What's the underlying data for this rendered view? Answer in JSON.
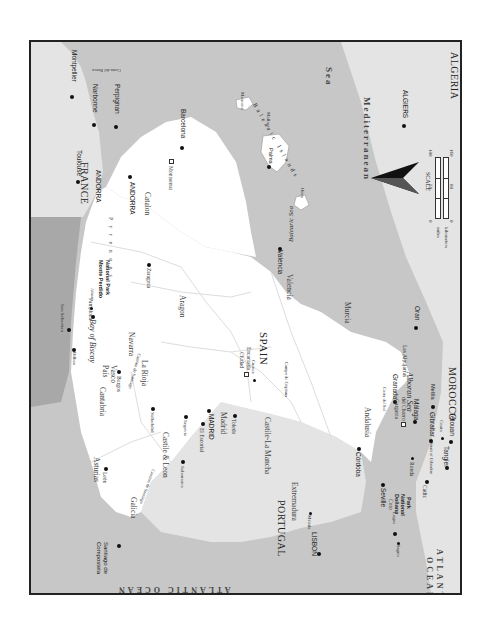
{
  "map": {
    "title": "SPAIN",
    "orientation": "rotated 90 degrees clockwise (north to the left)",
    "colors": {
      "spain_land": "#ffffff",
      "neighbor_land": "#e4e4e4",
      "sea": "#c7c7c7",
      "bay_of_biscay": "#a8a8a8",
      "border": "#222222",
      "region_lines": "#dddddd"
    },
    "countries": {
      "spain": "SPAIN",
      "france": "FRANCE",
      "portugal": "PORTUGAL",
      "andorra": "ANDORRA",
      "morocco": "MOROCCO",
      "algeria": "ALGERIA"
    },
    "seas": {
      "bay_of_biscay": "Bay of Biscay",
      "atlantic_top": "ATLANTIC OCEAN",
      "atlantic_bottom_1": "ATLANTIC",
      "atlantic_bottom_2": "OCEAN",
      "mediterranean_1": "Mediterranean",
      "mediterranean_2": "Sea",
      "balearic_sea": "Balearic Sea",
      "alboran_sea": "Alboran Sea",
      "strait": "Strait of Gibraltar",
      "costa_brava": "Costa del Brava",
      "costa_del_sol": "Costa del Sol",
      "balearic_islands": "Balearic Islands",
      "pyrenees": "P y r e n e e s"
    },
    "regions": {
      "galicia": "Galicia",
      "asturias": "Asturias",
      "cantabria": "Cantabria",
      "pais_vasco_1": "País",
      "pais_vasco_2": "Vasco",
      "navarra": "Navarra",
      "la_rioja": "La Rioja",
      "aragon": "Aragon",
      "catalon": "Catalon",
      "castile_leon": "Castile & Leon",
      "madrid": "Madrid",
      "castile_la_mancha": "Castile-La Mancha",
      "valencia": "Valencia",
      "murcia": "Murcia",
      "extremadura": "Extremadura",
      "andalusia": "Andalusia",
      "las_alpujarras": "Las Alpujarras",
      "camino_1": "Camino de Santiago",
      "camino_2": "Camino de Santiago",
      "campo": "Campo de Criptana",
      "menorca": "Menorca",
      "mallorca": "Mallorca",
      "ibiza": "Ibiza"
    },
    "cities": {
      "montpellier": "Montpellier",
      "narbonne": "Narbonne",
      "perpignan": "Perpignan",
      "toulouse": "Toulouse",
      "andorra_city": "ANDORRA",
      "barcelona": "Barcelona",
      "montserrat": "Montserrat",
      "palma": "Palma",
      "algiers": "ALGIERS",
      "oran": "Oran",
      "melilla": "Melilla",
      "san_sebastian": "San Sebastian",
      "bilbao": "Bilbao",
      "pamplona": "Pamplona",
      "ainsa": "Aínsa",
      "monte_perdido_1": "Monte Perdido",
      "monte_perdido_2": "National Park",
      "zaragoza": "Zaragoza",
      "burgos": "Burgos",
      "leon": "León",
      "valladolid": "Valladolid",
      "salamanca": "Salamanca",
      "segovia": "Segovia",
      "el_escorial": "El Escorial",
      "madrid_city": "MADRID",
      "toledo": "Toledo",
      "ciudad_1": "Ciudad",
      "ciudad_2": "Encantada",
      "cuenca": "Cuenca",
      "valencia_city": "Valencia",
      "santiago_1": "Santiago de",
      "santiago_2": "Compostela",
      "lisbon": "LISBON",
      "lagos": "Lagos",
      "sagres": "Sagres",
      "merida": "Mérida",
      "cordoba": "Córdoba",
      "granada": "Granada",
      "garganta_1": "Garganta",
      "garganta_2": "del Chorro",
      "malaga": "Málaga",
      "seville": "Seville",
      "coto_1": "Coto",
      "coto_2": "Doñana",
      "coto_3": "National",
      "coto_4": "Park",
      "ronda": "Ronda",
      "cadiz": "Cádiz",
      "gibraltar": "Gibraltar",
      "ceuta": "Ceuta",
      "tangier": "Tangier",
      "tetouan": "Tétouan"
    },
    "scale": {
      "label": "SCALE",
      "miles_label": "miles",
      "km_label": "kilometers",
      "miles_ticks": [
        "0",
        "50",
        "100"
      ],
      "km_ticks": [
        "0",
        "80",
        "160"
      ]
    },
    "compass": "north-arrow"
  }
}
